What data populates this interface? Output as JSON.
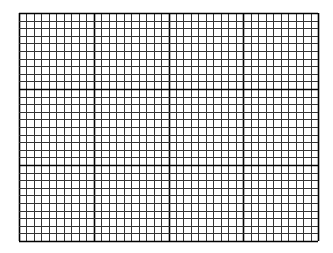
{
  "grid": {
    "left": 19,
    "top": 13,
    "width": 299,
    "height": 228,
    "columns": 40,
    "rows": 30,
    "major_every": 10,
    "minor_color": "#333333",
    "major_color": "#000000",
    "minor_width": 1,
    "major_width": 1.6,
    "background": "#ffffff"
  }
}
